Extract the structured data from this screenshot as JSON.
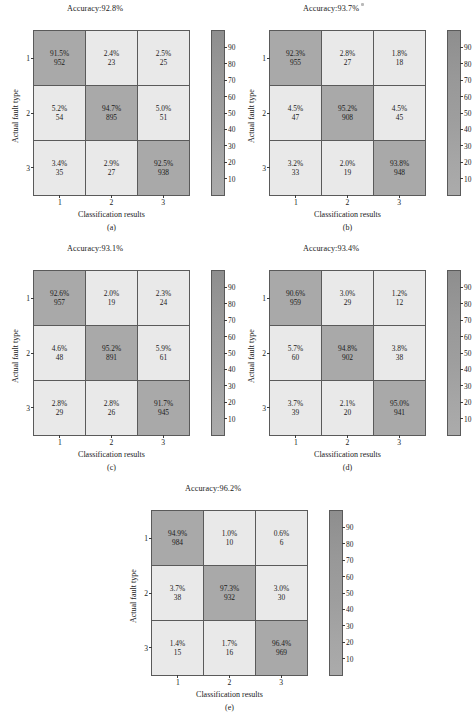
{
  "figure": {
    "axis_labels": {
      "x": "Classification results",
      "y": "Actual fault type"
    },
    "class_ticks": [
      "1",
      "2",
      "3"
    ],
    "colorbar_ticks": [
      "90",
      "80",
      "70",
      "60",
      "50",
      "40",
      "30",
      "20",
      "10"
    ],
    "colors": {
      "diagonal_cell": "#a9a9a9",
      "offdiagonal_cell": "#e9e9e9",
      "grid_line": "#5a5a5a",
      "text": "#1a1a1a",
      "colorbar_top": "#8e8e8e",
      "colorbar_bottom": "#ababab"
    }
  },
  "chart_data": [
    {
      "type": "heatmap",
      "id": "a",
      "letter": "(a)",
      "title": "Accuracy:92.8%",
      "accuracy": 92.8,
      "xlabel": "Classification results",
      "ylabel": "Actual fault type",
      "categories": [
        "1",
        "2",
        "3"
      ],
      "colorbar_range": [
        10,
        90
      ],
      "percent": [
        [
          91.5,
          2.4,
          2.5
        ],
        [
          5.2,
          94.7,
          5.0
        ],
        [
          3.4,
          2.9,
          92.5
        ]
      ],
      "counts": [
        [
          952,
          23,
          25
        ],
        [
          54,
          895,
          51
        ],
        [
          35,
          27,
          938
        ]
      ],
      "cells": [
        [
          {
            "pct": "91.5%",
            "cnt": "952"
          },
          {
            "pct": "2.4%",
            "cnt": "23"
          },
          {
            "pct": "2.5%",
            "cnt": "25"
          }
        ],
        [
          {
            "pct": "5.2%",
            "cnt": "54"
          },
          {
            "pct": "94.7%",
            "cnt": "895"
          },
          {
            "pct": "5.0%",
            "cnt": "51"
          }
        ],
        [
          {
            "pct": "3.4%",
            "cnt": "35"
          },
          {
            "pct": "2.9%",
            "cnt": "27"
          },
          {
            "pct": "92.5%",
            "cnt": "938"
          }
        ]
      ]
    },
    {
      "type": "heatmap",
      "id": "b",
      "letter": "(b)",
      "title": "Accuracy:93.7%",
      "accuracy": 93.7,
      "xlabel": "Classification results",
      "ylabel": "Actual fault type",
      "categories": [
        "1",
        "2",
        "3"
      ],
      "colorbar_range": [
        10,
        90
      ],
      "percent": [
        [
          92.3,
          2.8,
          1.8
        ],
        [
          4.5,
          95.2,
          4.5
        ],
        [
          3.2,
          2.0,
          93.8
        ]
      ],
      "counts": [
        [
          955,
          27,
          18
        ],
        [
          47,
          908,
          45
        ],
        [
          33,
          19,
          948
        ]
      ],
      "cells": [
        [
          {
            "pct": "92.3%",
            "cnt": "955"
          },
          {
            "pct": "2.8%",
            "cnt": "27"
          },
          {
            "pct": "1.8%",
            "cnt": "18"
          }
        ],
        [
          {
            "pct": "4.5%",
            "cnt": "47"
          },
          {
            "pct": "95.2%",
            "cnt": "908"
          },
          {
            "pct": "4.5%",
            "cnt": "45"
          }
        ],
        [
          {
            "pct": "3.2%",
            "cnt": "33"
          },
          {
            "pct": "2.0%",
            "cnt": "19"
          },
          {
            "pct": "93.8%",
            "cnt": "948"
          }
        ]
      ]
    },
    {
      "type": "heatmap",
      "id": "c",
      "letter": "(c)",
      "title": "Accuracy:93.1%",
      "accuracy": 93.1,
      "xlabel": "Classification results",
      "ylabel": "Actual fault type",
      "categories": [
        "1",
        "2",
        "3"
      ],
      "colorbar_range": [
        10,
        90
      ],
      "percent": [
        [
          92.6,
          2.0,
          2.3
        ],
        [
          4.6,
          95.2,
          5.9
        ],
        [
          2.8,
          2.8,
          91.7
        ]
      ],
      "counts": [
        [
          957,
          19,
          24
        ],
        [
          48,
          891,
          61
        ],
        [
          29,
          26,
          945
        ]
      ],
      "cells": [
        [
          {
            "pct": "92.6%",
            "cnt": "957"
          },
          {
            "pct": "2.0%",
            "cnt": "19"
          },
          {
            "pct": "2.3%",
            "cnt": "24"
          }
        ],
        [
          {
            "pct": "4.6%",
            "cnt": "48"
          },
          {
            "pct": "95.2%",
            "cnt": "891"
          },
          {
            "pct": "5.9%",
            "cnt": "61"
          }
        ],
        [
          {
            "pct": "2.8%",
            "cnt": "29"
          },
          {
            "pct": "2.8%",
            "cnt": "26"
          },
          {
            "pct": "91.7%",
            "cnt": "945"
          }
        ]
      ]
    },
    {
      "type": "heatmap",
      "id": "d",
      "letter": "(d)",
      "title": "Accuracy:93.4%",
      "accuracy": 93.4,
      "xlabel": "Classification results",
      "ylabel": "Actual fault type",
      "categories": [
        "1",
        "2",
        "3"
      ],
      "colorbar_range": [
        10,
        90
      ],
      "percent": [
        [
          90.6,
          3.0,
          1.2
        ],
        [
          5.7,
          94.8,
          3.8
        ],
        [
          3.7,
          2.1,
          95.0
        ]
      ],
      "counts": [
        [
          959,
          29,
          12
        ],
        [
          60,
          902,
          38
        ],
        [
          39,
          20,
          941
        ]
      ],
      "cells": [
        [
          {
            "pct": "90.6%",
            "cnt": "959"
          },
          {
            "pct": "3.0%",
            "cnt": "29"
          },
          {
            "pct": "1.2%",
            "cnt": "12"
          }
        ],
        [
          {
            "pct": "5.7%",
            "cnt": "60"
          },
          {
            "pct": "94.8%",
            "cnt": "902"
          },
          {
            "pct": "3.8%",
            "cnt": "38"
          }
        ],
        [
          {
            "pct": "3.7%",
            "cnt": "39"
          },
          {
            "pct": "2.1%",
            "cnt": "20"
          },
          {
            "pct": "95.0%",
            "cnt": "941"
          }
        ]
      ]
    },
    {
      "type": "heatmap",
      "id": "e",
      "letter": "(e)",
      "title": "Accuracy:96.2%",
      "accuracy": 96.2,
      "xlabel": "Classification results",
      "ylabel": "Actual fault type",
      "categories": [
        "1",
        "2",
        "3"
      ],
      "colorbar_range": [
        10,
        90
      ],
      "percent": [
        [
          94.9,
          1.0,
          0.6
        ],
        [
          3.7,
          97.3,
          3.0
        ],
        [
          1.4,
          1.7,
          96.4
        ]
      ],
      "counts": [
        [
          984,
          10,
          6
        ],
        [
          38,
          932,
          30
        ],
        [
          15,
          16,
          969
        ]
      ],
      "cells": [
        [
          {
            "pct": "94.9%",
            "cnt": "984"
          },
          {
            "pct": "1.0%",
            "cnt": "10"
          },
          {
            "pct": "0.6%",
            "cnt": "6"
          }
        ],
        [
          {
            "pct": "3.7%",
            "cnt": "38"
          },
          {
            "pct": "97.3%",
            "cnt": "932"
          },
          {
            "pct": "3.0%",
            "cnt": "30"
          }
        ],
        [
          {
            "pct": "1.4%",
            "cnt": "15"
          },
          {
            "pct": "1.7%",
            "cnt": "16"
          },
          {
            "pct": "96.4%",
            "cnt": "969"
          }
        ]
      ]
    }
  ]
}
